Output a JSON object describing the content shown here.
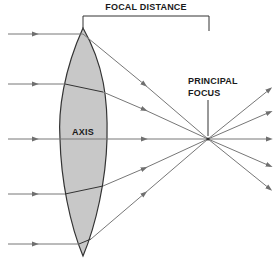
{
  "labels": {
    "focal_distance": "FOCAL DISTANCE",
    "principal": "PRINCIPAL",
    "focus": "FOCUS",
    "axis": "AXIS"
  },
  "colors": {
    "lens_fill": "#c8c8c8",
    "lens_stroke": "#333333",
    "ray": "#777777",
    "text": "#1a1a1a"
  },
  "rays": [
    {
      "id": "ray-1",
      "position": "top"
    },
    {
      "id": "ray-2",
      "position": "upper"
    },
    {
      "id": "ray-3",
      "position": "axis"
    },
    {
      "id": "ray-4",
      "position": "lower"
    },
    {
      "id": "ray-5",
      "position": "bottom"
    }
  ]
}
